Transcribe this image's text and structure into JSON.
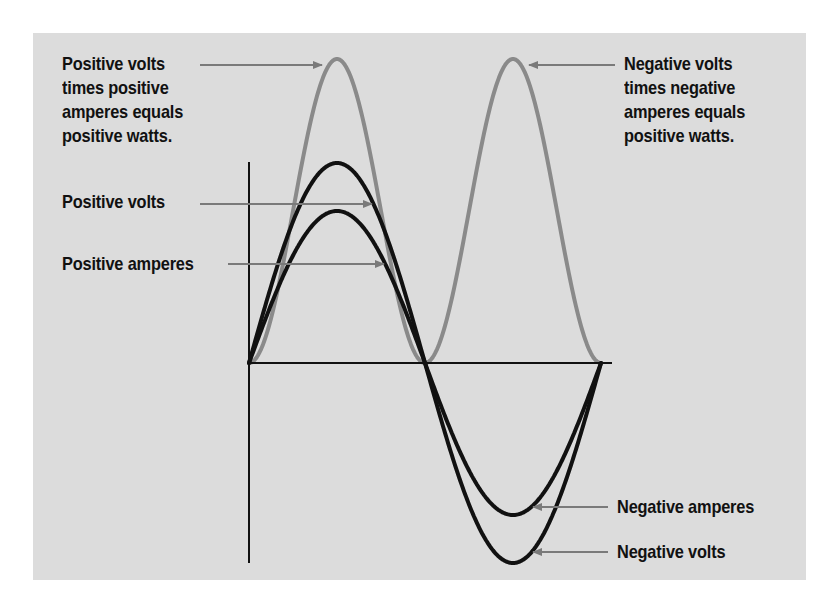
{
  "diagram": {
    "background": "#dcdcdc",
    "axis_color": "#111111",
    "curve_dark_color": "#111111",
    "curve_light_color": "#8a8a8a",
    "arrow_color": "#7a7a7a",
    "axes": {
      "origin": [
        249,
        363
      ],
      "y_axis_top": 162,
      "y_axis_bottom": 563,
      "x_axis_end": 612
    },
    "waveform": {
      "x_start": 249,
      "half_period_px": 176,
      "cycles": 1
    },
    "curves": [
      {
        "name": "watts",
        "kind": "power",
        "amplitude_px": 304,
        "color_key": "curve_light_color",
        "width": 4
      },
      {
        "name": "volts",
        "kind": "sine",
        "amplitude_px": 200,
        "color_key": "curve_dark_color",
        "width": 4
      },
      {
        "name": "amperes",
        "kind": "sine",
        "amplitude_px": 152,
        "color_key": "curve_dark_color",
        "width": 4
      }
    ],
    "labels": {
      "positive_watts": {
        "lines": [
          "Positive volts",
          "times positive",
          "amperes equals",
          "positive watts."
        ],
        "x": 62,
        "y": 52,
        "arrow": {
          "from": [
            200,
            65
          ],
          "to": [
            322,
            65
          ]
        }
      },
      "positive_volts": {
        "lines": [
          "Positive volts"
        ],
        "x": 62,
        "y": 190,
        "arrow": {
          "from": [
            200,
            204
          ],
          "to": [
            372,
            204
          ]
        }
      },
      "positive_amperes": {
        "lines": [
          "Positive amperes"
        ],
        "x": 62,
        "y": 252,
        "arrow": {
          "from": [
            228,
            264
          ],
          "to": [
            384,
            264
          ]
        }
      },
      "negative_watts": {
        "lines": [
          "Negative volts",
          "times negative",
          "amperes equals",
          "positive watts."
        ],
        "x": 624,
        "y": 52,
        "arrow": {
          "from": [
            615,
            65
          ],
          "to": [
            529,
            65
          ]
        }
      },
      "negative_amperes": {
        "lines": [
          "Negative amperes"
        ],
        "x": 617,
        "y": 495,
        "arrow": {
          "from": [
            608,
            507
          ],
          "to": [
            533,
            507
          ]
        }
      },
      "negative_volts": {
        "lines": [
          "Negative volts"
        ],
        "x": 617,
        "y": 540,
        "arrow": {
          "from": [
            608,
            552
          ],
          "to": [
            533,
            552
          ]
        }
      }
    }
  }
}
